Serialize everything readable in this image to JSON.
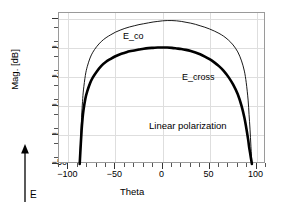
{
  "chart_data": {
    "type": "line",
    "title": "",
    "xlabel": "Theta",
    "ylabel": "Mag. [dB]",
    "xlim": [
      -110,
      110
    ],
    "ylim": [
      -50,
      2
    ],
    "xticks": [
      -100,
      -50,
      0,
      50,
      100
    ],
    "xticklabels": [
      "-100",
      "-50",
      "0",
      "50",
      "100"
    ],
    "xminor_step": 10,
    "yticks": [
      0,
      -10,
      -20,
      -30,
      -40,
      -50
    ],
    "yticklabels": [
      "0",
      "-10",
      "-20",
      "-30",
      "-40",
      "-50"
    ],
    "yminor_step": 5,
    "grid": true,
    "legend_position": "inline-annotations",
    "annotations": [
      {
        "text": "E_co",
        "x": -97,
        "y": -1.8
      },
      {
        "text": "E_cross",
        "x": -2,
        "y": -15.8
      },
      {
        "text": "Linear polarization",
        "x": -25,
        "y": -32.6
      },
      {
        "text": "E",
        "x": null,
        "y": null
      }
    ],
    "series": [
      {
        "name": "E_co",
        "linewidth": "thin",
        "color": "#000000",
        "x": [
          -88,
          -87,
          -86,
          -85,
          -84,
          -82,
          -80,
          -77,
          -74,
          -70,
          -65,
          -60,
          -55,
          -50,
          -45,
          -40,
          -35,
          -30,
          -25,
          -20,
          -15,
          -10,
          -5,
          0,
          5,
          10,
          15,
          20,
          25,
          30,
          35,
          40,
          45,
          50,
          55,
          60,
          65,
          70,
          75,
          80,
          84,
          87,
          89,
          91,
          92,
          93,
          94,
          95
        ],
        "y": [
          -50.0,
          -42.0,
          -34.0,
          -28.5,
          -24.5,
          -19.5,
          -16.5,
          -13.5,
          -11.5,
          -9.6,
          -7.8,
          -6.5,
          -5.5,
          -4.6,
          -3.9,
          -3.3,
          -2.8,
          -2.4,
          -2.0,
          -1.7,
          -1.4,
          -1.1,
          -0.9,
          -0.7,
          -0.6,
          -0.6,
          -0.7,
          -0.9,
          -1.2,
          -1.5,
          -1.9,
          -2.4,
          -2.9,
          -3.5,
          -4.2,
          -5.0,
          -6.0,
          -7.3,
          -9.0,
          -11.4,
          -14.5,
          -18.0,
          -22.0,
          -28.0,
          -33.0,
          -38.0,
          -44.0,
          -50.0
        ]
      },
      {
        "name": "E_cross",
        "linewidth": "thick",
        "color": "#000000",
        "x": [
          -88,
          -87,
          -86,
          -85,
          -84,
          -82,
          -80,
          -77,
          -74,
          -70,
          -65,
          -60,
          -55,
          -50,
          -45,
          -40,
          -35,
          -30,
          -25,
          -20,
          -15,
          -10,
          -5,
          0,
          5,
          10,
          15,
          20,
          25,
          30,
          35,
          40,
          45,
          50,
          55,
          60,
          65,
          70,
          75,
          80,
          84,
          87,
          89,
          91,
          92,
          93,
          94,
          95
        ],
        "y": [
          -50.0,
          -44.0,
          -38.5,
          -34.5,
          -31.5,
          -27.5,
          -25.0,
          -22.2,
          -20.2,
          -18.2,
          -16.2,
          -14.8,
          -13.8,
          -12.9,
          -12.2,
          -11.7,
          -11.2,
          -10.9,
          -10.6,
          -10.3,
          -10.1,
          -10.0,
          -9.9,
          -9.9,
          -9.9,
          -10.0,
          -10.2,
          -10.4,
          -10.7,
          -11.1,
          -11.6,
          -12.2,
          -13.0,
          -13.9,
          -15.0,
          -16.3,
          -17.9,
          -20.0,
          -22.6,
          -26.0,
          -30.0,
          -34.0,
          -37.5,
          -41.5,
          -44.0,
          -46.0,
          -48.0,
          -50.0
        ]
      }
    ]
  },
  "axis": {
    "ylabel": "Mag. [dB]",
    "xlabel": "Theta"
  },
  "e_field": {
    "label": "E",
    "icon": "up-arrow-icon"
  }
}
